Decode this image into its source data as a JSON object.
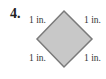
{
  "problem": {
    "number": "4.",
    "shape": "square rotated 45° (diamond)",
    "side_labels": {
      "top_left": "1 in.",
      "top_right": "1 in.",
      "bottom_left": "1 in.",
      "bottom_right": "1 in."
    },
    "colors": {
      "fill": "#c8c8c8",
      "stroke": "#7a7a7a"
    }
  }
}
